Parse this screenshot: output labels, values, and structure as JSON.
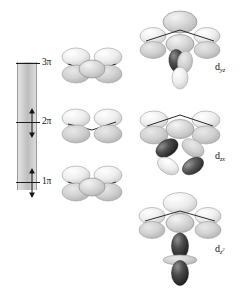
{
  "figure": {
    "type": "molecular-orbital-energy-diagram",
    "background_color": "#ffffff"
  },
  "energy_axis": {
    "name": "energy-axis",
    "orientation": "vertical",
    "gradient_from": "#e2e2e2",
    "gradient_to": "#bdbdbd",
    "direction_label": "increasing energy upward"
  },
  "levels": [
    {
      "id": "level-3pi",
      "label": "3π",
      "occupancy": "empty",
      "electrons": 0,
      "arrows": []
    },
    {
      "id": "level-2pi",
      "label": "2π",
      "occupancy": "filled",
      "electrons": 2,
      "arrows": [
        "up",
        "down"
      ]
    },
    {
      "id": "level-1pi",
      "label": "1π",
      "occupancy": "filled",
      "electrons": 2,
      "arrows": [
        "up",
        "down"
      ]
    }
  ],
  "left_orbitals": [
    {
      "id": "ligand-pi-3",
      "level": "3π",
      "description": "three-lobe ligand π combination"
    },
    {
      "id": "ligand-pi-2",
      "level": "2π",
      "description": "two-lobe ligand π combination"
    },
    {
      "id": "ligand-pi-1",
      "level": "1π",
      "description": "three-lobe ligand π combination"
    }
  ],
  "right_orbitals": [
    {
      "id": "mo-dyz",
      "label_base": "d",
      "label_sub": "yz",
      "metal_orbital": "d-yz",
      "lobe_count": 2,
      "description": "vertical two-lobe d orbital below ligand π set"
    },
    {
      "id": "mo-dzx",
      "label_base": "d",
      "label_sub": "zx",
      "metal_orbital": "d-zx",
      "lobe_count": 4,
      "description": "four-lobe cloverleaf d orbital below ligand π set"
    },
    {
      "id": "mo-dz2",
      "label_base": "d",
      "label_sub": "z",
      "label_sup": "2",
      "metal_orbital": "d-z2",
      "lobe_count": 2,
      "has_torus": true,
      "description": "two-lobe d orbital with equatorial torus below ligand π set"
    }
  ],
  "colors": {
    "lobe_light": "#e8e8e8",
    "lobe_mid": "#c6c6c6",
    "lobe_dark": "#3a3a3a",
    "outline": "#8a8a8a",
    "bond_line": "#2b2b2b",
    "text": "#111111"
  }
}
